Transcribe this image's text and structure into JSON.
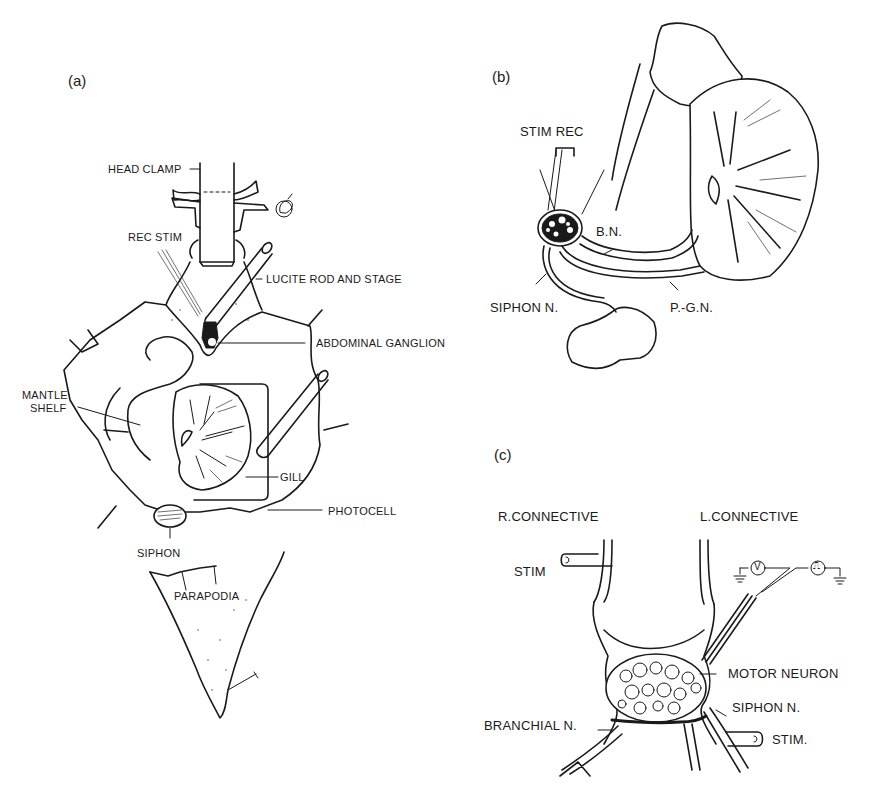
{
  "figure": {
    "panels": [
      {
        "id": "a",
        "letter": "(a)",
        "labels": {
          "head_clamp": "HEAD CLAMP",
          "rec_stim": "REC  STIM",
          "lucite_rod": "LUCITE ROD AND STAGE",
          "abdominal_ganglion": "ABDOMINAL GANGLION",
          "mantle_shelf_1": "MANTLE",
          "mantle_shelf_2": "SHELF",
          "gill": "GILL",
          "photocell": "PHOTOCELL",
          "siphon": "SIPHON",
          "parapodia": "PARAPODIA"
        }
      },
      {
        "id": "b",
        "letter": "(b)",
        "labels": {
          "stim_rec": "STIM  REC",
          "bn": "B.N.",
          "siphon_n": "SIPHON N.",
          "pgn": "P.-G.N."
        }
      },
      {
        "id": "c",
        "letter": "(c)",
        "labels": {
          "r_connective": "R.CONNECTIVE",
          "l_connective": "L.CONNECTIVE",
          "stim_top": "STIM",
          "motor_neuron": "MOTOR NEURON",
          "siphon_n": "SIPHON N.",
          "branchial_n": "BRANCHIAL N.",
          "stim_bottom": "STIM.",
          "voltmeter_symbol": "V",
          "pulse_symbol": "⎍"
        }
      }
    ],
    "colors": {
      "ink": "#1a1a1a",
      "background": "#ffffff"
    }
  }
}
